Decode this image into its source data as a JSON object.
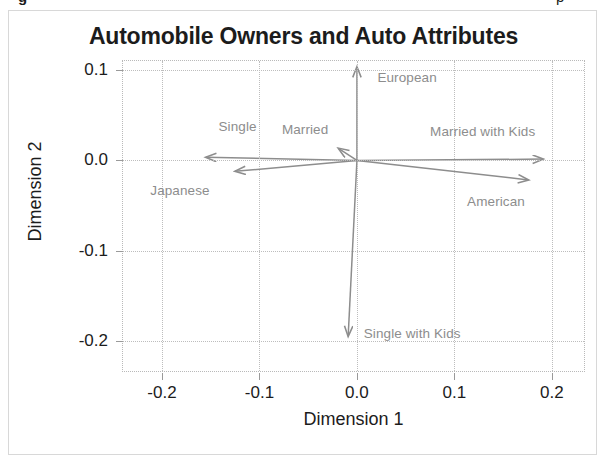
{
  "figure": {
    "title": "Automobile Owners and Auto Attributes",
    "top_fragments": [
      "g",
      "p"
    ]
  },
  "chart_data": {
    "type": "scatter",
    "subtype": "biplot-vectors",
    "title": "Automobile Owners and Auto Attributes",
    "xlabel": "Dimension 1",
    "ylabel": "Dimension 2",
    "xlim": [
      -0.24,
      0.235
    ],
    "ylim": [
      -0.235,
      0.11
    ],
    "xticks": [
      -0.2,
      -0.1,
      0.0,
      0.1,
      0.2
    ],
    "xticklabels": [
      "-0.2",
      "-0.1",
      "0.0",
      "0.1",
      "0.2"
    ],
    "yticks": [
      0.1,
      0.0,
      -0.1,
      -0.2
    ],
    "yticklabels": [
      "0.1",
      "0.0",
      "-0.1",
      "-0.2"
    ],
    "grid": true,
    "legend": "none",
    "origin": [
      0.0,
      0.0
    ],
    "vectors": [
      {
        "label": "European",
        "x": 0.0,
        "y": 0.1035,
        "label_x": 0.021,
        "label_y": 0.0905
      },
      {
        "label": "Single",
        "x": -0.155,
        "y": 0.0035,
        "label_x": -0.142,
        "label_y": 0.0355
      },
      {
        "label": "Married",
        "x": -0.019,
        "y": 0.0135,
        "label_x": -0.077,
        "label_y": 0.0325
      },
      {
        "label": "Japanese",
        "x": -0.125,
        "y": -0.012,
        "label_x": -0.212,
        "label_y": -0.0345
      },
      {
        "label": "Married with Kids",
        "x": 0.191,
        "y": 0.0015,
        "label_x": 0.075,
        "label_y": 0.0305
      },
      {
        "label": "American",
        "x": 0.176,
        "y": -0.0215,
        "label_x": 0.113,
        "label_y": -0.0465
      },
      {
        "label": "Single with Kids",
        "x": -0.009,
        "y": -0.1945,
        "label_x": 0.007,
        "label_y": -0.1925
      }
    ]
  },
  "colors": {
    "vector": "#8d8d8d",
    "label": "#8d8d8d",
    "axis_text": "#1c1c1c",
    "grid": "#bdbdbd",
    "frame": "#d8d8d8"
  }
}
